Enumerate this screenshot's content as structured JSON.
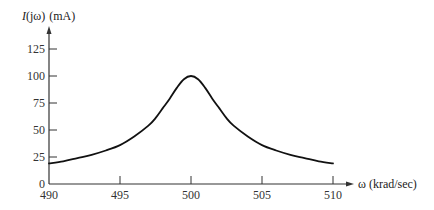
{
  "chart_data": {
    "type": "line",
    "title": "",
    "xlabel": "ω (krad/sec)",
    "ylabel": "I(jω) (mA)",
    "xlim": [
      490,
      511.5
    ],
    "ylim": [
      0,
      140
    ],
    "x_ticks": [
      490,
      495,
      500,
      505,
      510
    ],
    "y_ticks": [
      0,
      25,
      50,
      75,
      100,
      125
    ],
    "grid": false,
    "legend": null,
    "series": [
      {
        "name": "I(jω)",
        "color": "#111111",
        "x": [
          490,
          491,
          492,
          493,
          494,
          495,
          496,
          497,
          497.5,
          498,
          498.5,
          499,
          499.5,
          500,
          500.5,
          501,
          501.5,
          502,
          502.5,
          503,
          504,
          505,
          506,
          507,
          508,
          509,
          510
        ],
        "values": [
          19,
          21,
          24,
          27,
          31,
          36,
          44,
          54,
          61,
          70,
          79,
          89,
          97,
          100,
          97,
          89,
          79,
          70,
          61,
          54,
          44,
          36,
          31,
          27,
          24,
          21,
          19
        ]
      }
    ]
  },
  "axes": {
    "y_title_prefix": "I",
    "y_title_paren": "(jω)",
    "y_title_unit": "(mA)",
    "x_title": "ω (krad/sec)"
  }
}
